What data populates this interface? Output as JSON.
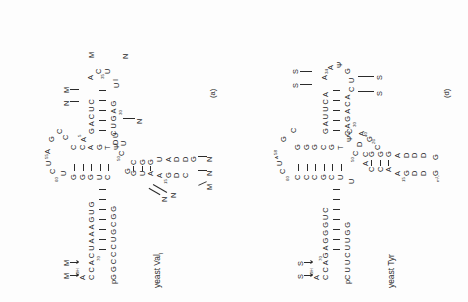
{
  "figure": {
    "background": "#fdfdfd",
    "ink": "#2b2b2b",
    "type": "tRNA cloverleaf secondary structure diagrams",
    "panel_count": 2
  },
  "panels": [
    {
      "id": "a",
      "label": "(a)",
      "title_main": "yeast Val",
      "title_sub": "I",
      "acceptor_stem": {
        "three_prime_label": "A",
        "three_prime_sup": "OH",
        "top_strand": [
          "A",
          "C",
          "C",
          "A",
          "C",
          "U",
          "A",
          "A",
          "A",
          "G",
          "U",
          "G"
        ],
        "top_strand_numbers": {
          "index": 1,
          "value": "70"
        },
        "bottom_strand": [
          "pG",
          "G",
          "C",
          "C",
          "C",
          "U",
          "G",
          "C",
          "G",
          "G"
        ],
        "pair_count": 7
      },
      "t_arm": {
        "loop": [
          "C",
          "U",
          "A",
          "G",
          "C",
          "U"
        ],
        "loop_number": "60",
        "loop_number2": "55",
        "stem_upper": [
          "G",
          "G",
          "G",
          "U",
          "C"
        ],
        "stem_lower": [
          "C",
          "C",
          "A",
          "G",
          "T",
          "Ψ",
          "C"
        ],
        "joint": [
          "C",
          "U",
          "C"
        ],
        "joint_number": "50"
      },
      "d_arm": {
        "upper_strand": [
          "G",
          "C",
          "U",
          "G",
          "A"
        ],
        "lower_strand": [
          "G",
          "G",
          "U",
          "A",
          "D",
          "D",
          "G"
        ],
        "loop": [
          "C",
          "D",
          "G",
          "A",
          "G"
        ],
        "loop_number": "15",
        "modified_callouts": [
          "M",
          "N",
          "N",
          "N",
          "N"
        ]
      },
      "anticodon_arm": {
        "stem_top": [
          "G",
          "A",
          "C",
          "U",
          "C"
        ],
        "stem_bottom": [
          "C",
          "U",
          "G",
          "A",
          "G"
        ],
        "stem_number": "30",
        "loop": [
          "A",
          "C",
          "U",
          "U",
          "A",
          "C",
          "I"
        ],
        "loop_number": "35",
        "callouts": [
          "N",
          "M",
          "M",
          "N",
          "N"
        ]
      },
      "callout_labels_top": [
        "M",
        "M"
      ],
      "callout_labels_misc": [
        "N",
        "N",
        "N",
        "M",
        "N",
        "N"
      ]
    },
    {
      "id": "d",
      "label": "(d)",
      "title_main": "yeast Tyr",
      "title_sub": "",
      "acceptor_stem": {
        "three_prime_label": "A",
        "three_prime_sup": "OH",
        "top_strand": [
          "A",
          "C",
          "C",
          "A",
          "G",
          "A",
          "G",
          "G",
          "G",
          "U",
          "C"
        ],
        "top_strand_numbers": {
          "index": 1,
          "value": "70"
        },
        "bottom_strand": [
          "pC",
          "U",
          "U",
          "C",
          "U",
          "U",
          "G",
          "G"
        ],
        "pair_count": 7
      },
      "t_arm": {
        "loop": [
          "C",
          "U",
          "C",
          "G",
          "C",
          "C"
        ],
        "loop_number": "60",
        "loop_number2": "A",
        "stem_upper": [
          "C",
          "C",
          "C",
          "G",
          "C",
          "U"
        ],
        "stem_lower": [
          "G",
          "G",
          "G",
          "C",
          "G",
          "T",
          "Ψ",
          "C"
        ],
        "joint": [
          "C",
          "D"
        ],
        "joint_number": "50"
      },
      "d_arm": {
        "upper_strand": [
          "A",
          "C",
          "C",
          "G"
        ],
        "lower_strand": [
          "A",
          "G",
          "G",
          "C",
          "G"
        ],
        "loop": [
          "D",
          "G",
          "A",
          "A",
          "C",
          "C"
        ],
        "loop_number": "15",
        "loop_extra": [
          "D",
          "D",
          "D",
          "A",
          "G"
        ],
        "m2G_label": "m²₂G"
      },
      "anticodon_arm": {
        "stem_top": [
          "G",
          "A",
          "U",
          "U",
          "C",
          "A"
        ],
        "stem_bottom": [
          "C",
          "A",
          "G",
          "A",
          "C",
          "A"
        ],
        "stem_number": "30",
        "loop": [
          "A",
          "A",
          "Ψ",
          "A",
          "G",
          "U",
          "C"
        ],
        "loop_number": "35",
        "callouts": [
          "S",
          "S",
          "S",
          "S"
        ]
      },
      "callout_labels_top": [
        "S",
        "S"
      ],
      "callout_labels_misc": [
        "S",
        "S",
        "S",
        "S"
      ]
    }
  ]
}
